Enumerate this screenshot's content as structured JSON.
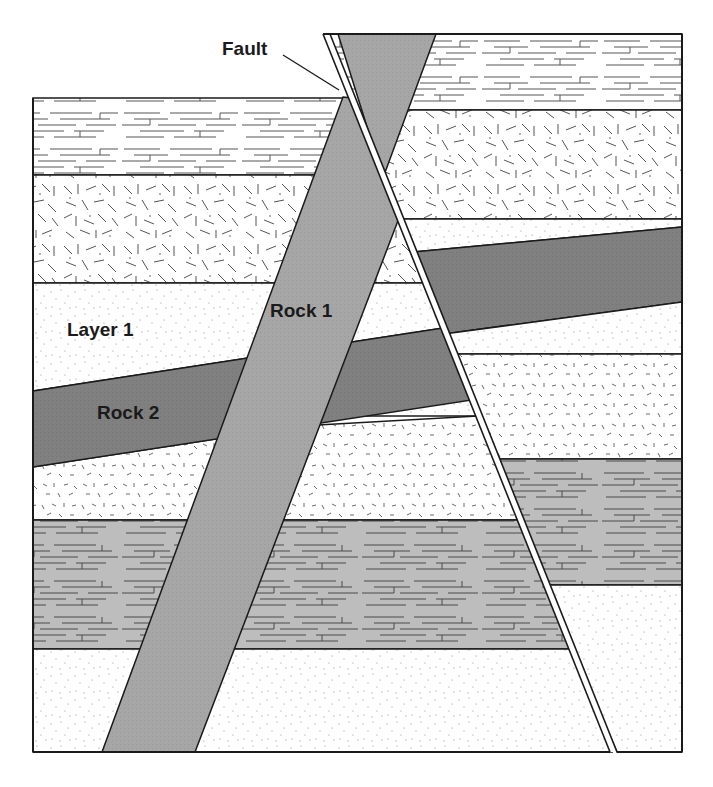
{
  "diagram": {
    "type": "geologic cross-section",
    "labels": {
      "fault": "Fault",
      "rock1": "Rock 1",
      "rock2": "Rock 2",
      "layer1": "Layer 1"
    },
    "colors": {
      "rock1_fill": "#a6a6a6",
      "rock2_fill": "#7f7f7f",
      "shale_fill": "#bdbdbd",
      "background": "#ffffff",
      "line": "#1a1a1a"
    },
    "blocks": {
      "left_block_layers_top_to_bottom": [
        "limestone",
        "granite-texture",
        "sandstone (Layer 1)",
        "Rock 2 intrusion",
        "dashed-sand",
        "shale (gray)",
        "sandstone"
      ],
      "right_block_layers_top_to_bottom": [
        "limestone",
        "granite-texture",
        "sandstone",
        "Rock 2 intrusion",
        "sandstone",
        "dashed-sand",
        "shale (gray)",
        "sandstone"
      ]
    }
  }
}
